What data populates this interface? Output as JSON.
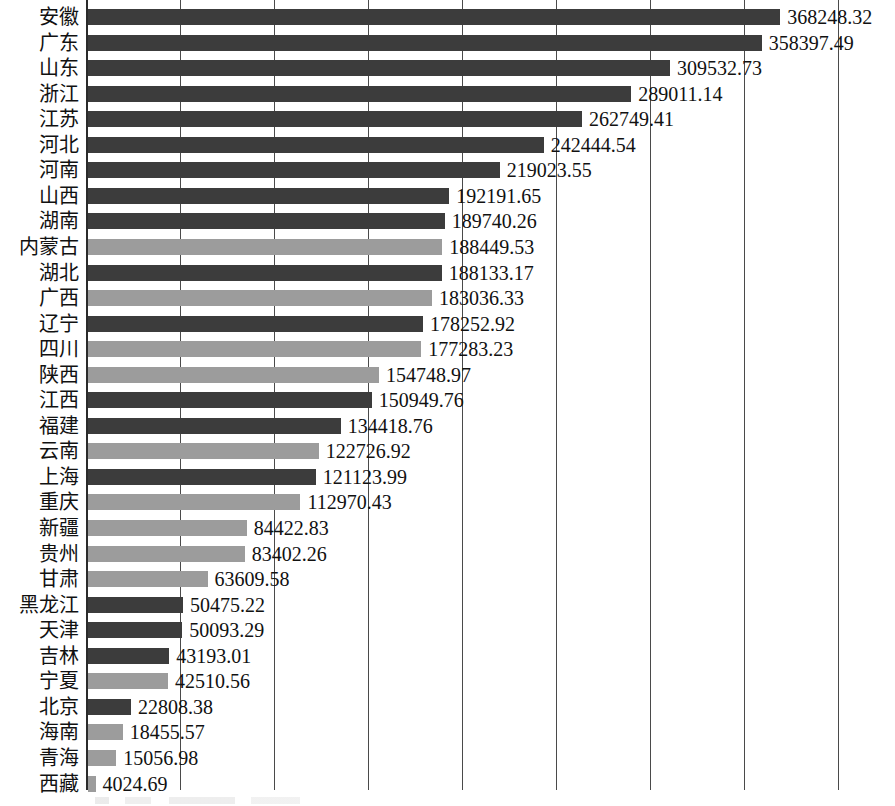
{
  "chart_data": {
    "type": "bar",
    "orientation": "horizontal",
    "title": "",
    "subtitle": "",
    "xlabel": "",
    "ylabel": "",
    "xlim": [
      0,
      400000
    ],
    "grid": true,
    "gridline_values": [
      50000,
      100000,
      150000,
      200000,
      250000,
      300000,
      350000,
      400000
    ],
    "legend_position": "none",
    "value_format": "2 decimal places",
    "categories": [
      "安徽",
      "广东",
      "山东",
      "浙江",
      "江苏",
      "河北",
      "河南",
      "山西",
      "湖南",
      "内蒙古",
      "湖北",
      "广西",
      "辽宁",
      "四川",
      "陕西",
      "江西",
      "福建",
      "云南",
      "上海",
      "重庆",
      "新疆",
      "贵州",
      "甘肃",
      "黑龙江",
      "天津",
      "吉林",
      "宁夏",
      "北京",
      "海南",
      "青海",
      "西藏"
    ],
    "values": [
      368248.32,
      358397.49,
      309532.73,
      289011.14,
      262749.41,
      242444.54,
      219023.55,
      192191.65,
      189740.26,
      188449.53,
      188133.17,
      183036.33,
      178252.92,
      177283.23,
      154748.97,
      150949.76,
      134418.76,
      122726.92,
      121123.99,
      112970.43,
      84422.83,
      83402.26,
      63609.58,
      50475.22,
      50093.29,
      43193.01,
      42510.56,
      22808.38,
      18455.57,
      15056.98,
      4024.69
    ],
    "value_labels": [
      "368248.32",
      "358397.49",
      "309532.73",
      "289011.14",
      "262749.41",
      "242444.54",
      "219023.55",
      "192191.65",
      "189740.26",
      "188449.53",
      "188133.17",
      "183036.33",
      "178252.92",
      "177283.23",
      "154748.97",
      "150949.76",
      "134418.76",
      "122726.92",
      "121123.99",
      "112970.43",
      "84422.83",
      "83402.26",
      "63609.58",
      "50475.22",
      "50093.29",
      "43193.01",
      "42510.56",
      "22808.38",
      "18455.57",
      "15056.98",
      "4024.69"
    ],
    "bar_styles": [
      "dark",
      "dark",
      "dark",
      "dark",
      "dark",
      "dark",
      "dark",
      "dark",
      "dark",
      "light",
      "dark",
      "light",
      "dark",
      "light",
      "light",
      "dark",
      "dark",
      "light",
      "dark",
      "light",
      "light",
      "light",
      "light",
      "dark",
      "dark",
      "dark",
      "light",
      "dark",
      "light",
      "light",
      "light"
    ],
    "colors": {
      "dark": "#3c3c3c",
      "light": "#9c9c9c",
      "axis": "#2b2b2b",
      "gridline": "#4a4a4a",
      "text": "#111111",
      "background": "#ffffff"
    }
  }
}
